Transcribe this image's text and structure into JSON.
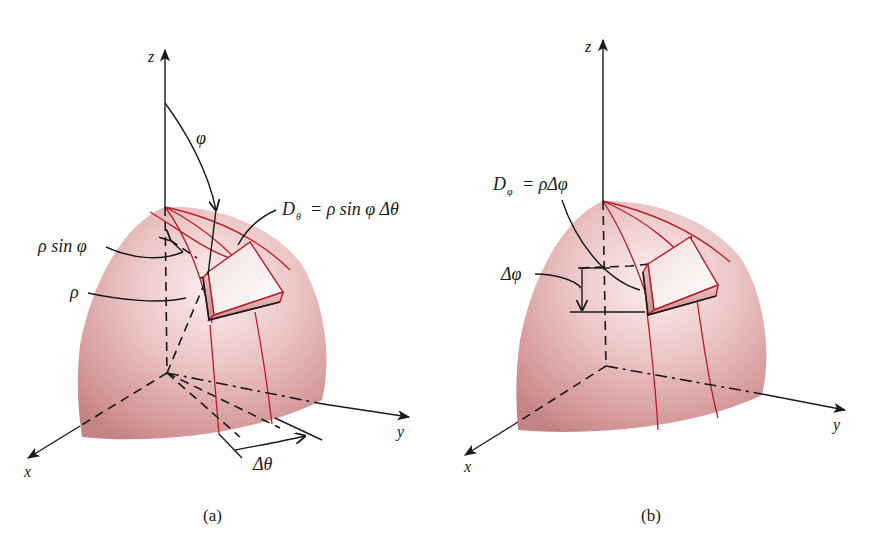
{
  "figure": {
    "panels": [
      {
        "id": "a",
        "caption": "(a)",
        "axes": {
          "z": "z",
          "x": "x",
          "y": "y"
        },
        "labels": {
          "phi": "φ",
          "rho_sin_phi": "ρ sin φ",
          "rho": "ρ",
          "d_theta_lhs": "D",
          "d_theta_sub": "θ",
          "d_theta_rhs": "= ρ sin φ Δθ",
          "delta_theta": "Δθ"
        }
      },
      {
        "id": "b",
        "caption": "(b)",
        "axes": {
          "z": "z",
          "x": "x",
          "y": "y"
        },
        "labels": {
          "d_phi_lhs": "D",
          "d_phi_sub": "φ",
          "d_phi_rhs": "= ρΔφ",
          "delta_phi": "Δφ"
        }
      }
    ],
    "colors": {
      "surface_light": "#f7e6e6",
      "surface_mid": "#e2aeae",
      "surface_dark": "#c07a7c",
      "meridian_red": "#b81c2a",
      "ink": "#1a1a1a"
    }
  }
}
